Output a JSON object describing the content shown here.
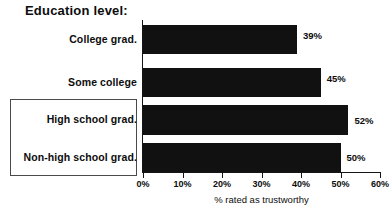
{
  "chart_data": {
    "type": "bar",
    "orientation": "horizontal",
    "title": "Education level:",
    "categories": [
      "College grad.",
      "Some college",
      "High school grad.",
      "Non-high school grad."
    ],
    "values": [
      39,
      45,
      52,
      50
    ],
    "value_labels": [
      "39%",
      "45%",
      "52%",
      "50%"
    ],
    "xlabel": "% rated as trustworthy",
    "ylabel": "",
    "xlim": [
      0,
      60
    ],
    "xticks": [
      0,
      10,
      20,
      30,
      40,
      50,
      60
    ],
    "xtick_labels": [
      "0%",
      "10%",
      "20%",
      "30%",
      "40%",
      "50%",
      "60%"
    ],
    "grid": false,
    "legend": false,
    "bar_color": "#111111",
    "axis_color": "#141414",
    "background": "#ffffff",
    "annotations": [
      {
        "name": "highlight-box",
        "description": "rectangle outline around the two bottom category labels",
        "categories": [
          "High school grad.",
          "Non-high school grad."
        ],
        "color": "#4a4a4a"
      }
    ]
  }
}
